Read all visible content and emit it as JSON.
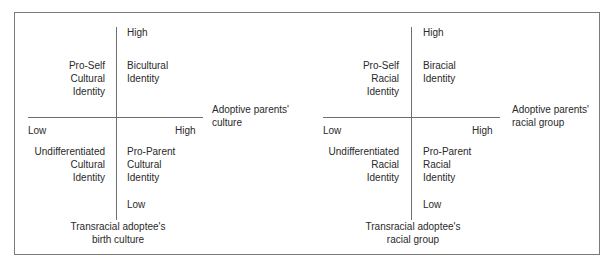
{
  "diagrams": [
    {
      "y_high": "High",
      "y_low": "Low",
      "x_low": "Low",
      "x_high": "High",
      "x_axis_label": [
        "Adoptive parents'",
        "culture"
      ],
      "y_axis_label": [
        "Transracial adoptee's",
        "birth culture"
      ],
      "quadrants": {
        "top_left": [
          "Pro-Self",
          "Cultural",
          "Identity"
        ],
        "top_right": [
          "Bicultural",
          "Identity"
        ],
        "bottom_left": [
          "Undifferentiated",
          "Cultural",
          "Identity"
        ],
        "bottom_right": [
          "Pro-Parent",
          "Cultural",
          "Identity"
        ]
      }
    },
    {
      "y_high": "High",
      "y_low": "Low",
      "x_low": "Low",
      "x_high": "High",
      "x_axis_label": [
        "Adoptive parents'",
        "racial group"
      ],
      "y_axis_label": [
        "Transracial adoptee's",
        "racial group"
      ],
      "quadrants": {
        "top_left": [
          "Pro-Self",
          "Racial",
          "Identity"
        ],
        "top_right": [
          "Biracial",
          "Identity"
        ],
        "bottom_left": [
          "Undifferentiated",
          "Racial",
          "Identity"
        ],
        "bottom_right": [
          "Pro-Parent",
          "Racial",
          "Identity"
        ]
      }
    }
  ]
}
